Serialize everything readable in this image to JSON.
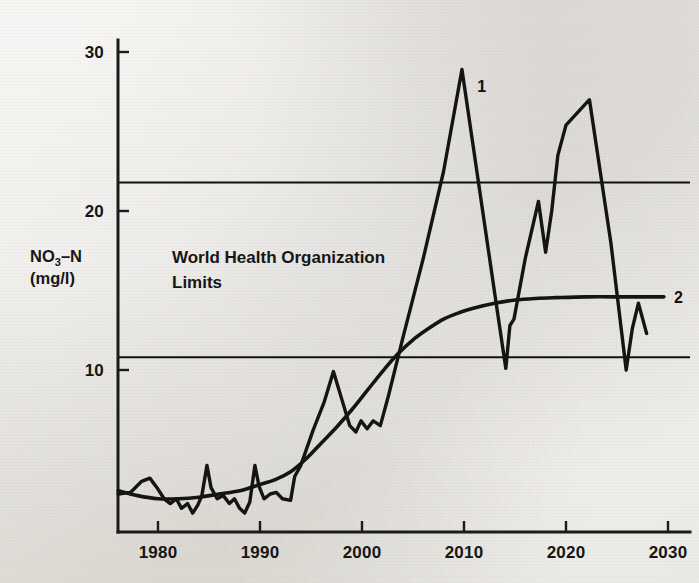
{
  "chart_data": {
    "type": "line",
    "title": "",
    "xlabel": "",
    "ylabel": "NO3-N (mg/l)",
    "ylabel_line1_main": "NO",
    "ylabel_line1_sub": "3",
    "ylabel_line1_tail": "–N",
    "ylabel_line2": "(mg/l)",
    "xlim": [
      1976,
      2030.5
    ],
    "ylim": [
      0,
      31.5
    ],
    "grid": false,
    "legend_position": "inline-end-of-line",
    "x_ticks": [
      1980,
      1990,
      2000,
      2010,
      2020,
      2030
    ],
    "x_tick_labels": [
      "1980",
      "1990",
      "2000",
      "2010",
      "2020",
      "2030"
    ],
    "y_ticks": [
      10,
      20,
      30
    ],
    "y_tick_labels": [
      "10",
      "20",
      "30"
    ],
    "annotations": [
      {
        "name": "who-limits-text",
        "line1": "World Health Organization",
        "line2": "Limits",
        "x": 1982.5,
        "y": 17.6
      }
    ],
    "reference_lines": [
      {
        "name": "who-upper-limit",
        "value": 21.8,
        "label": ""
      },
      {
        "name": "who-lower-limit",
        "value": 10.8,
        "label": ""
      }
    ],
    "series": [
      {
        "name": "1",
        "label": "1",
        "description": "Measured nitrate concentration (oscillating)",
        "label_x": 2011.3,
        "label_y": 27.5,
        "points": [
          [
            1976.1,
            2.2
          ],
          [
            1977.3,
            2.3
          ],
          [
            1978.4,
            3.0
          ],
          [
            1979.2,
            3.2
          ],
          [
            1979.9,
            2.6
          ],
          [
            1980.6,
            1.9
          ],
          [
            1981.2,
            1.6
          ],
          [
            1981.8,
            1.9
          ],
          [
            1982.3,
            1.3
          ],
          [
            1982.9,
            1.6
          ],
          [
            1983.4,
            1.0
          ],
          [
            1983.9,
            1.5
          ],
          [
            1984.3,
            2.1
          ],
          [
            1984.8,
            4.0
          ],
          [
            1985.2,
            2.6
          ],
          [
            1985.8,
            1.9
          ],
          [
            1986.4,
            2.1
          ],
          [
            1987.0,
            1.6
          ],
          [
            1987.5,
            1.9
          ],
          [
            1988.0,
            1.3
          ],
          [
            1988.5,
            1.0
          ],
          [
            1989.0,
            1.7
          ],
          [
            1989.5,
            4.0
          ],
          [
            1989.9,
            2.7
          ],
          [
            1990.4,
            1.9
          ],
          [
            1991.0,
            2.2
          ],
          [
            1991.6,
            2.3
          ],
          [
            1992.2,
            1.9
          ],
          [
            1993.0,
            1.8
          ],
          [
            1993.4,
            3.3
          ],
          [
            1994.0,
            4.0
          ],
          [
            1995.2,
            6.2
          ],
          [
            1996.3,
            8.0
          ],
          [
            1997.2,
            9.9
          ],
          [
            1998.0,
            8.2
          ],
          [
            1998.8,
            6.5
          ],
          [
            1999.4,
            6.1
          ],
          [
            1999.9,
            6.8
          ],
          [
            2000.5,
            6.3
          ],
          [
            2001.1,
            6.8
          ],
          [
            2001.8,
            6.5
          ],
          [
            2002.6,
            8.4
          ],
          [
            2004.0,
            12.0
          ],
          [
            2006.0,
            17.0
          ],
          [
            2008.0,
            22.5
          ],
          [
            2009.8,
            28.9
          ],
          [
            2011.6,
            21.0
          ],
          [
            2013.2,
            14.0
          ],
          [
            2014.1,
            10.1
          ],
          [
            2014.5,
            12.8
          ],
          [
            2014.9,
            13.2
          ],
          [
            2016.0,
            17.0
          ],
          [
            2017.3,
            20.6
          ],
          [
            2018.0,
            17.4
          ],
          [
            2018.6,
            20.0
          ],
          [
            2019.2,
            23.5
          ],
          [
            2020.0,
            25.4
          ],
          [
            2022.3,
            27.0
          ],
          [
            2024.4,
            18.0
          ],
          [
            2025.9,
            10.0
          ],
          [
            2026.5,
            12.6
          ],
          [
            2027.1,
            14.2
          ],
          [
            2027.9,
            12.3
          ]
        ]
      },
      {
        "name": "2",
        "label": "2",
        "description": "Modelled / smoothed trend (sigmoid)",
        "label_x": 2030.6,
        "label_y": 14.5,
        "points": [
          [
            1976.1,
            2.4
          ],
          [
            1978.0,
            2.1
          ],
          [
            1980.0,
            1.9
          ],
          [
            1982.0,
            1.9
          ],
          [
            1984.0,
            2.0
          ],
          [
            1986.0,
            2.2
          ],
          [
            1988.0,
            2.4
          ],
          [
            1990.0,
            2.8
          ],
          [
            1991.5,
            3.1
          ],
          [
            1993.0,
            3.6
          ],
          [
            1994.5,
            4.4
          ],
          [
            1996.0,
            5.4
          ],
          [
            1997.5,
            6.4
          ],
          [
            1999.0,
            7.5
          ],
          [
            2000.5,
            8.7
          ],
          [
            2002.0,
            9.9
          ],
          [
            2003.5,
            11.0
          ],
          [
            2005.0,
            11.9
          ],
          [
            2006.5,
            12.6
          ],
          [
            2008.0,
            13.2
          ],
          [
            2009.5,
            13.6
          ],
          [
            2011.0,
            13.9
          ],
          [
            2013.0,
            14.2
          ],
          [
            2015.0,
            14.4
          ],
          [
            2017.0,
            14.5
          ],
          [
            2019.0,
            14.55
          ],
          [
            2022.0,
            14.6
          ],
          [
            2026.0,
            14.6
          ],
          [
            2029.6,
            14.6
          ]
        ]
      }
    ]
  },
  "figure": {
    "background_color": "#e9e7e2",
    "ink_color": "#141414"
  }
}
